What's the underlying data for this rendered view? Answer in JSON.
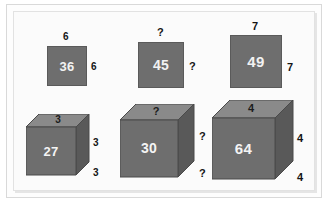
{
  "figure": {
    "background_color": "#fbfbfb",
    "face_colors": {
      "front": "#6e6e6e",
      "top": "#8a8a8a",
      "side": "#595959",
      "outline": "#4a4a4a",
      "face_text": "#f2f2f2",
      "dim_text": "#141414"
    }
  },
  "shapes": [
    {
      "id": "square-36",
      "kind": "square",
      "face_value": "36",
      "dim_top": "6",
      "dim_right": "6"
    },
    {
      "id": "square-45",
      "kind": "square",
      "face_value": "45",
      "dim_top": "?",
      "dim_right": "?"
    },
    {
      "id": "square-49",
      "kind": "square",
      "face_value": "49",
      "dim_top": "7",
      "dim_right": "7"
    },
    {
      "id": "cube-27",
      "kind": "cube",
      "face_value": "27",
      "top_value": "3",
      "dim_right_upper": "3",
      "dim_right_lower": "3"
    },
    {
      "id": "cube-30",
      "kind": "cube",
      "face_value": "30",
      "top_value": "?",
      "dim_right_upper": "?",
      "dim_right_lower": "?"
    },
    {
      "id": "cube-64",
      "kind": "cube",
      "face_value": "64",
      "top_value": "4",
      "dim_right_upper": "4",
      "dim_right_lower": "4"
    }
  ]
}
